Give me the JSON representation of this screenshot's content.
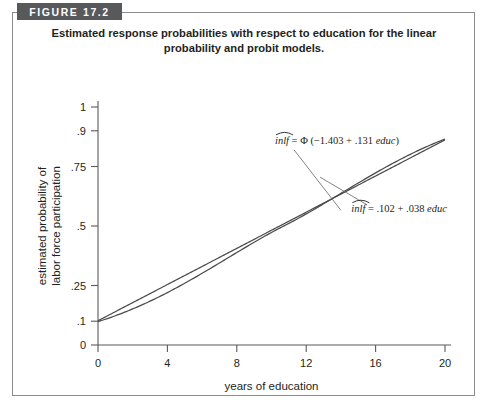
{
  "figure": {
    "badge_label": "FIGURE 17.2",
    "caption": "Estimated response probabilities with respect to education for the linear probability and probit models."
  },
  "chart_data": {
    "type": "line",
    "title": "Estimated response probabilities with respect to education for the linear probability and probit models.",
    "xlabel": "years of education",
    "ylabel": "estimated probability of labor force participation",
    "ylabel_line1": "estimated probability of",
    "ylabel_line2": "labor force participation",
    "xlim": [
      0,
      20
    ],
    "ylim": [
      0,
      1
    ],
    "grid": false,
    "legend_position": "inline-annotation",
    "xticks": [
      0,
      4,
      8,
      12,
      16,
      20
    ],
    "xtick_labels": [
      "0",
      "4",
      "8",
      "12",
      "16",
      "20"
    ],
    "yticks": [
      0,
      0.1,
      0.25,
      0.5,
      0.75,
      0.9,
      1
    ],
    "ytick_labels": [
      "0",
      ".1",
      ".25",
      ".5",
      ".75",
      ".9",
      "1"
    ],
    "x": [
      0,
      1,
      2,
      3,
      4,
      5,
      6,
      7,
      8,
      9,
      10,
      11,
      12,
      13,
      14,
      15,
      16,
      17,
      18,
      19,
      20
    ],
    "series": [
      {
        "name": "probit",
        "model": "probit",
        "equation_prefix": "inlf",
        "equation_body": " = Φ (−1.403 + .131 ",
        "equation_var": "educ",
        "equation_suffix": ")",
        "intercept": -1.403,
        "slope": 0.131,
        "values": [
          0.08,
          0.101,
          0.126,
          0.155,
          0.189,
          0.228,
          0.272,
          0.32,
          0.372,
          0.428,
          0.486,
          0.545,
          0.604,
          0.661,
          0.714,
          0.763,
          0.807,
          0.846,
          0.879,
          0.906,
          0.929
        ],
        "annotation_x": 10.2,
        "annotation_y": 0.845
      },
      {
        "name": "linear probability",
        "model": "linear",
        "equation_prefix": "inlf",
        "equation_body": " = .102 + .038 ",
        "equation_var": "educ",
        "equation_suffix": "",
        "intercept": 0.102,
        "slope": 0.038,
        "values": [
          0.102,
          0.14,
          0.178,
          0.216,
          0.254,
          0.292,
          0.33,
          0.368,
          0.406,
          0.444,
          0.482,
          0.52,
          0.558,
          0.596,
          0.634,
          0.672,
          0.71,
          0.748,
          0.786,
          0.824,
          0.862
        ],
        "annotation_x": 14.6,
        "annotation_y": 0.56
      }
    ]
  },
  "colors": {
    "badge_background": "#58595b",
    "badge_text": "#ffffff",
    "frame_border": "#8b8b8d",
    "axis": "#58595b",
    "curve": "#4b4b4d",
    "leader": "#76767a",
    "text": "#231f20",
    "background": "#ffffff"
  }
}
